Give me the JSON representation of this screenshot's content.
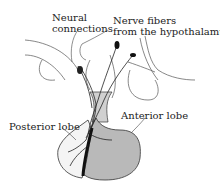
{
  "diagram": {
    "labels": {
      "neural_connections_line1": "Neural",
      "neural_connections_line2": "connections",
      "nerve_fibers_line1": "Nerve fibers",
      "nerve_fibers_line2": "from the hypothalamus",
      "posterior_lobe": "Posterior lobe",
      "anterior_lobe": "Anterior lobe"
    },
    "colors": {
      "anterior_fill": "#b9b9b9",
      "posterior_fill": "#f4f4f4",
      "stroke": "#333333",
      "background": "#ffffff"
    }
  }
}
